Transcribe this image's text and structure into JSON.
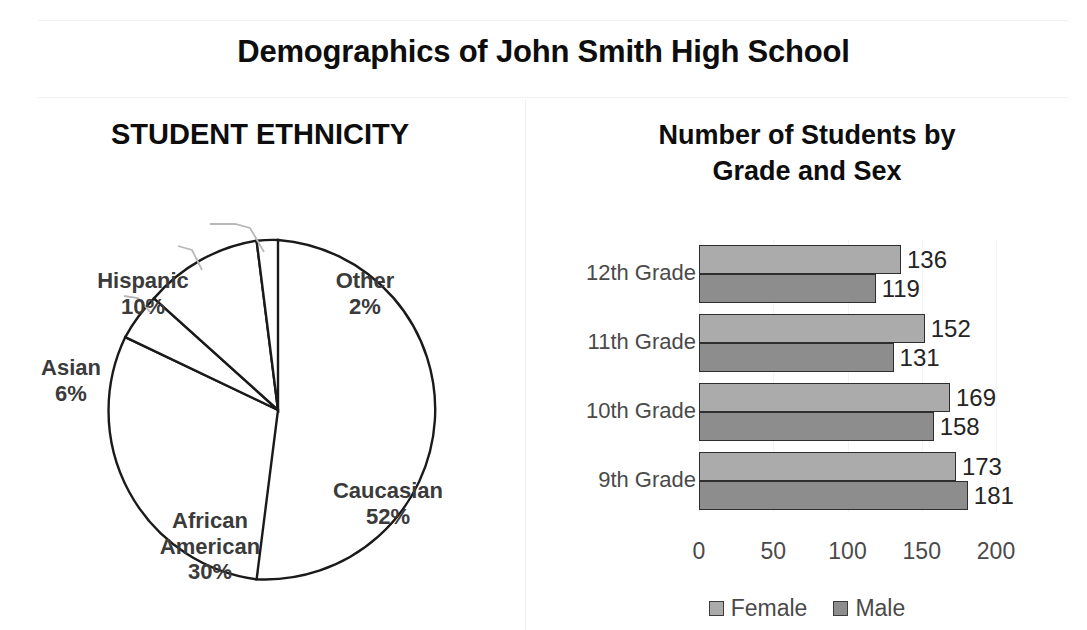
{
  "title": "Demographics of John Smith High School",
  "pie": {
    "title": "STUDENT ETHNICITY",
    "labels": {
      "hispanic": {
        "name": "Hispanic",
        "pct": "10%"
      },
      "other": {
        "name": "Other",
        "pct": "2%"
      },
      "asian": {
        "name": "Asian",
        "pct": "6%"
      },
      "african": {
        "name": "African",
        "name2": "American",
        "pct": "30%"
      },
      "caucasian": {
        "name": "Caucasian",
        "pct": "52%"
      }
    }
  },
  "bar": {
    "title_line1": "Number of Students by",
    "title_line2": "Grade and Sex",
    "legend": [
      {
        "label": "Female",
        "color": "#ababab"
      },
      {
        "label": "Male",
        "color": "#8d8d8d"
      }
    ],
    "ticks": [
      "0",
      "50",
      "100",
      "150",
      "200"
    ],
    "grades": [
      {
        "label": "12th Grade",
        "female": "136",
        "male": "119"
      },
      {
        "label": "11th Grade",
        "female": "152",
        "male": "131"
      },
      {
        "label": "10th Grade",
        "female": "169",
        "male": "158"
      },
      {
        "label": "9th Grade",
        "female": "173",
        "male": "181"
      }
    ]
  },
  "chart_data": [
    {
      "type": "pie",
      "title": "STUDENT ETHNICITY",
      "categories": [
        "Caucasian",
        "African American",
        "Asian",
        "Hispanic",
        "Other"
      ],
      "values": [
        52,
        30,
        6,
        10,
        2
      ],
      "value_labels": [
        "52%",
        "30%",
        "6%",
        "10%",
        "2%"
      ],
      "units": "percent",
      "start_angle_deg": 0,
      "direction": "clockwise",
      "fill": "none",
      "stroke": "#1a1a1a",
      "legend": "none",
      "labels_position": "outside-and-inside-with-leader-lines"
    },
    {
      "type": "bar",
      "orientation": "horizontal",
      "title": "Number of Students by Grade and Sex",
      "categories": [
        "12th Grade",
        "11th Grade",
        "10th Grade",
        "9th Grade"
      ],
      "series": [
        {
          "name": "Female",
          "values": [
            136,
            152,
            169,
            173
          ],
          "color": "#ababab"
        },
        {
          "name": "Male",
          "values": [
            119,
            131,
            158,
            181
          ],
          "color": "#8d8d8d"
        }
      ],
      "xlabel": "",
      "ylabel": "",
      "xlim": [
        0,
        200
      ],
      "xticks": [
        0,
        50,
        100,
        150,
        200
      ],
      "grid": true,
      "data_labels": true,
      "legend_position": "bottom"
    }
  ]
}
